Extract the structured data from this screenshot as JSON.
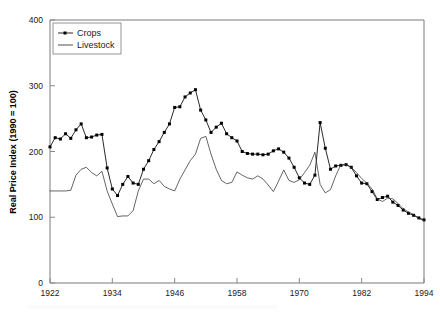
{
  "chart_data": {
    "type": "line",
    "title": "",
    "subtitle": "",
    "xlabel": "",
    "ylabel": "Real Price Index (1990 = 100)",
    "xlim": [
      1922,
      1994
    ],
    "ylim": [
      0,
      400
    ],
    "yticks": [
      0,
      100,
      200,
      300,
      400
    ],
    "xticks": [
      1922,
      1934,
      1946,
      1958,
      1970,
      1982,
      1994
    ],
    "grid": false,
    "legend_position": "top-left",
    "x": [
      1922,
      1923,
      1924,
      1925,
      1926,
      1927,
      1928,
      1929,
      1930,
      1931,
      1932,
      1933,
      1934,
      1935,
      1936,
      1937,
      1938,
      1939,
      1940,
      1941,
      1942,
      1943,
      1944,
      1945,
      1946,
      1947,
      1948,
      1949,
      1950,
      1951,
      1952,
      1953,
      1954,
      1955,
      1956,
      1957,
      1958,
      1959,
      1960,
      1961,
      1962,
      1963,
      1964,
      1965,
      1966,
      1967,
      1968,
      1969,
      1970,
      1971,
      1972,
      1973,
      1974,
      1975,
      1976,
      1977,
      1978,
      1979,
      1980,
      1981,
      1982,
      1983,
      1984,
      1985,
      1986,
      1987,
      1988,
      1989,
      1990,
      1991,
      1992,
      1993,
      1994
    ],
    "series": [
      {
        "name": "Crops",
        "marker": "filled-square",
        "line_style": "solid",
        "color": "#111111",
        "values": [
          207,
          221,
          219,
          227,
          220,
          233,
          242,
          221,
          222,
          225,
          226,
          175,
          143,
          133,
          150,
          162,
          152,
          150,
          173,
          186,
          203,
          215,
          229,
          242,
          267,
          268,
          283,
          289,
          294,
          263,
          248,
          229,
          237,
          243,
          227,
          221,
          216,
          200,
          197,
          196,
          196,
          195,
          196,
          201,
          204,
          199,
          190,
          176,
          160,
          152,
          150,
          164,
          244,
          205,
          173,
          178,
          179,
          180,
          176,
          163,
          152,
          151,
          139,
          127,
          130,
          132,
          123,
          118,
          111,
          106,
          103,
          99,
          96
        ]
      },
      {
        "name": "Livestock",
        "marker": "none",
        "line_style": "solid",
        "color": "#333333",
        "values": [
          140,
          140,
          140,
          140,
          141,
          164,
          173,
          176,
          168,
          163,
          170,
          140,
          120,
          101,
          102,
          102,
          110,
          140,
          158,
          158,
          151,
          156,
          147,
          143,
          140,
          158,
          172,
          186,
          196,
          220,
          223,
          196,
          173,
          156,
          151,
          153,
          169,
          164,
          160,
          158,
          163,
          158,
          149,
          139,
          155,
          172,
          156,
          153,
          157,
          168,
          179,
          199,
          150,
          137,
          142,
          163,
          180,
          180,
          176,
          168,
          159,
          152,
          143,
          128,
          124,
          129,
          128,
          121,
          113,
          108,
          104,
          98,
          95
        ]
      }
    ]
  },
  "legend": {
    "crops_label": "Crops",
    "livestock_label": "Livestock"
  },
  "axes": {
    "ytitle": "Real Price Index (1990 = 100)",
    "ytick_labels": [
      "0",
      "100",
      "200",
      "300",
      "400"
    ],
    "xtick_labels": [
      "1922",
      "1934",
      "1946",
      "1958",
      "1970",
      "1982",
      "1994"
    ]
  }
}
